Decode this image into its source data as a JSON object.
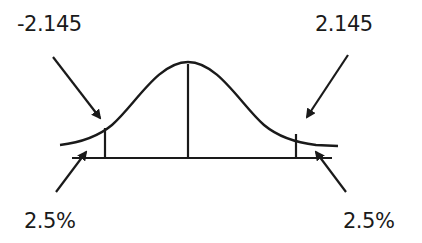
{
  "diagram": {
    "type": "t-distribution two-tailed critical region",
    "labels": {
      "left_critical": "-2.145",
      "right_critical": "2.145",
      "left_tail": "2.5%",
      "right_tail": "2.5%"
    },
    "colors": {
      "stroke": "#1a1a1a",
      "background": "#ffffff"
    }
  }
}
